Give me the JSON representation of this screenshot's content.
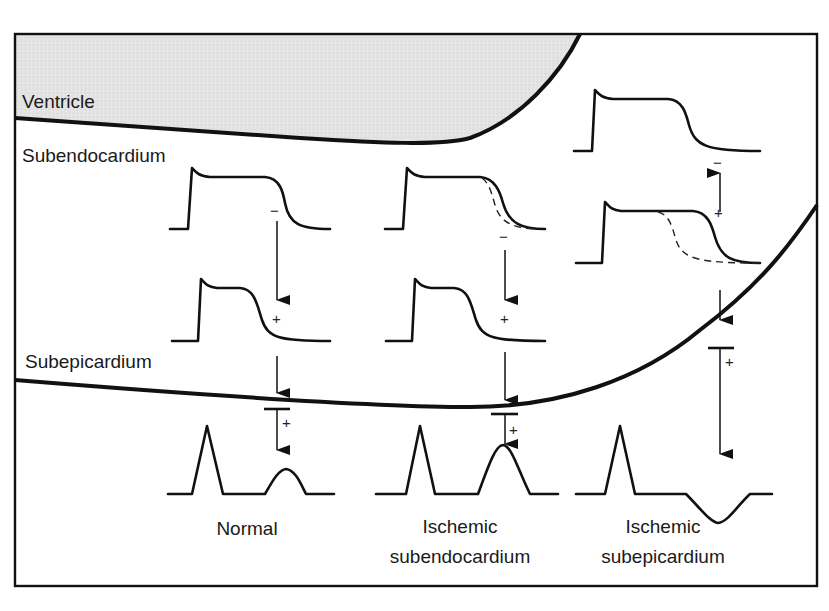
{
  "diagram": {
    "layers": {
      "ventricle": "Ventricle",
      "subendocardium": "Subendocardium",
      "subepicardium": "Subepicardium"
    },
    "columns": [
      {
        "id": "normal",
        "title_line1": "Normal",
        "title_line2": ""
      },
      {
        "id": "ischemic-subendocardium",
        "title_line1": "Ischemic",
        "title_line2": "subendocardium"
      },
      {
        "id": "ischemic-subepicardium",
        "title_line1": "Ischemic",
        "title_line2": "subepicardium"
      }
    ],
    "signs": {
      "minus": "−",
      "plus": "+"
    },
    "colors": {
      "ventricle_fill": "#e2e2e2",
      "line": "#111111",
      "background": "#ffffff"
    }
  }
}
